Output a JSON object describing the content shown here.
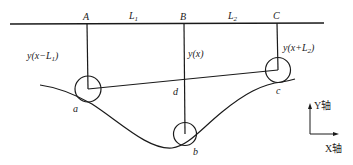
{
  "diagram": {
    "colors": {
      "line": "#1a1a1a",
      "text": "#222222",
      "background": "#ffffff"
    },
    "points": {
      "A": "A",
      "B": "B",
      "C": "C",
      "a": "a",
      "b": "b",
      "c": "c",
      "d": "d"
    },
    "spans": {
      "L1_main": "L",
      "L1_sub": "1",
      "L2_main": "L",
      "L2_sub": "2"
    },
    "labels": {
      "left_prefix": "y(x−L",
      "left_sub": "1",
      "left_suffix": ")",
      "middle": "y(x)",
      "right_prefix": "y(x+L",
      "right_sub": "2",
      "right_suffix": ")"
    },
    "axes": {
      "y_label": "Y轴",
      "x_label": "X轴"
    }
  }
}
